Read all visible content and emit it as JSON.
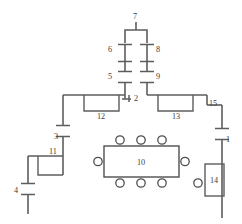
{
  "diagram": {
    "type": "floor-plan",
    "canvas": {
      "width": 242,
      "height": 224
    },
    "colors": {
      "wall": "#5d5d5d",
      "label": "#3d3d3d",
      "background": "#ffffff",
      "furniture": "#4f4f4f"
    },
    "labels": {
      "n1": "1",
      "n2": "2",
      "n3": "3",
      "n4": "4",
      "n5": "5",
      "n6": "6",
      "n7": "7",
      "n8": "8",
      "n9": "9",
      "n10": "10",
      "n11": "11",
      "n12": "12",
      "n13": "13",
      "n14": "14",
      "n15": "15"
    },
    "nodes": [
      {
        "id": "7",
        "label": "7",
        "kind": "corridor-junction",
        "x": 136,
        "y": 16
      },
      {
        "id": "6",
        "label": "6",
        "kind": "door",
        "x": 112,
        "y": 50
      },
      {
        "id": "8",
        "label": "8",
        "kind": "door",
        "x": 159,
        "y": 50
      },
      {
        "id": "5",
        "label": "5",
        "kind": "door",
        "x": 112,
        "y": 76
      },
      {
        "id": "9",
        "label": "9",
        "kind": "door",
        "x": 159,
        "y": 76
      },
      {
        "id": "2",
        "label": "2",
        "kind": "door",
        "x": 135,
        "y": 98
      },
      {
        "id": "12",
        "label": "12",
        "kind": "room",
        "x": 98,
        "y": 117
      },
      {
        "id": "13",
        "label": "13",
        "kind": "room",
        "x": 176,
        "y": 117
      },
      {
        "id": "15",
        "label": "15",
        "kind": "door",
        "x": 212,
        "y": 103
      },
      {
        "id": "1",
        "label": "1",
        "kind": "door",
        "x": 228,
        "y": 140
      },
      {
        "id": "14",
        "label": "14",
        "kind": "room",
        "x": 213,
        "y": 182
      },
      {
        "id": "3",
        "label": "3",
        "kind": "door",
        "x": 57,
        "y": 137
      },
      {
        "id": "11",
        "label": "11",
        "kind": "room",
        "x": 53,
        "y": 163
      },
      {
        "id": "4",
        "label": "4",
        "kind": "door",
        "x": 17,
        "y": 190
      },
      {
        "id": "10",
        "label": "10",
        "kind": "table",
        "x": 141,
        "y": 163
      }
    ],
    "furniture": {
      "table_10": {
        "label": "10",
        "x": 104,
        "y": 146,
        "width": 75,
        "height": 31,
        "chairs_top": 3,
        "chairs_bottom": 3,
        "chairs_left": 1,
        "chairs_right": 1,
        "chair_radius": 4.2
      },
      "fixture_circle_14": {
        "cx": 198,
        "cy": 183,
        "r": 4.2
      }
    }
  }
}
